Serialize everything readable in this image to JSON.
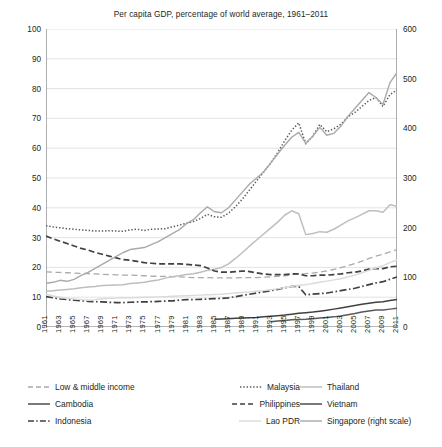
{
  "chart_data": {
    "type": "line",
    "title": "Per capita GDP, percentage of world average, 1961–2011",
    "xlabel": "",
    "ylabel": "",
    "ylabel_right": "",
    "xlim": [
      1961,
      2011
    ],
    "ylim": [
      0,
      100
    ],
    "ylim_right": [
      0,
      600
    ],
    "ytick_labels": [
      "100",
      "90",
      "80",
      "70",
      "60",
      "50",
      "40",
      "30",
      "20",
      "10",
      "0"
    ],
    "ytick_values": [
      100,
      90,
      80,
      70,
      60,
      50,
      40,
      30,
      20,
      10,
      0
    ],
    "ytick_right_labels": [
      "600",
      "500",
      "400",
      "300",
      "200",
      "100",
      "0"
    ],
    "ytick_right_values": [
      600,
      500,
      400,
      300,
      200,
      100,
      0
    ],
    "grid": "horizontal",
    "legend_position": "below",
    "xtick_labels": [
      "1961",
      "1963",
      "1965",
      "1967",
      "1969",
      "1971",
      "1973",
      "1975",
      "1977",
      "1979",
      "1981",
      "1983",
      "1985",
      "1987",
      "1989",
      "1991",
      "1993",
      "1995",
      "1997",
      "1999",
      "2001",
      "2003",
      "2005",
      "2007",
      "2009",
      "2011"
    ],
    "x": [
      1961,
      1962,
      1963,
      1964,
      1965,
      1966,
      1967,
      1968,
      1969,
      1970,
      1971,
      1972,
      1973,
      1974,
      1975,
      1976,
      1977,
      1978,
      1979,
      1980,
      1981,
      1982,
      1983,
      1984,
      1985,
      1986,
      1987,
      1988,
      1989,
      1990,
      1991,
      1992,
      1993,
      1994,
      1995,
      1996,
      1997,
      1998,
      1999,
      2000,
      2001,
      2002,
      2003,
      2004,
      2005,
      2006,
      2007,
      2008,
      2009,
      2010,
      2011
    ],
    "series": [
      {
        "name": "Low & middle income",
        "style": "dashed",
        "color": "#a7a9ac",
        "axis": "left",
        "values": [
          18.5,
          18.4,
          18.3,
          18.2,
          18.1,
          18.0,
          17.9,
          17.8,
          17.7,
          17.6,
          17.5,
          17.4,
          17.4,
          17.3,
          17.2,
          17.1,
          17.0,
          17.0,
          16.9,
          16.8,
          16.7,
          16.6,
          16.6,
          16.6,
          16.5,
          16.5,
          16.5,
          16.5,
          16.6,
          16.6,
          16.6,
          16.7,
          16.8,
          17.0,
          17.2,
          17.5,
          17.8,
          17.9,
          18.1,
          18.4,
          18.8,
          19.3,
          19.9,
          20.6,
          21.3,
          22.1,
          23.0,
          23.8,
          24.4,
          25.2,
          26.0
        ]
      },
      {
        "name": "Malaysia",
        "style": "dotted",
        "color": "#58595b",
        "axis": "left",
        "values": [
          34.0,
          33.6,
          33.3,
          33.0,
          32.8,
          32.6,
          32.4,
          32.2,
          32.2,
          32.3,
          32.2,
          32.1,
          32.6,
          32.8,
          32.4,
          32.8,
          32.9,
          33.0,
          33.6,
          34.2,
          34.8,
          35.4,
          36.4,
          37.8,
          37.0,
          36.8,
          38.2,
          40.4,
          43.0,
          46.0,
          49.0,
          52.0,
          55.0,
          58.5,
          62.5,
          66.0,
          68.5,
          61.5,
          64.0,
          68.0,
          65.5,
          66.5,
          68.0,
          70.5,
          72.0,
          74.0,
          76.0,
          77.0,
          74.0,
          78.0,
          79.5
        ]
      },
      {
        "name": "Thailand",
        "style": "solid",
        "color": "#bcbec0",
        "axis": "left",
        "values": [
          12.0,
          12.2,
          12.4,
          12.6,
          12.8,
          13.2,
          13.4,
          13.6,
          13.9,
          14.0,
          14.1,
          14.2,
          14.6,
          14.8,
          15.0,
          15.4,
          15.8,
          16.4,
          16.9,
          17.2,
          17.6,
          17.9,
          18.4,
          19.0,
          19.4,
          20.0,
          21.2,
          23.0,
          25.0,
          27.2,
          29.2,
          31.2,
          33.2,
          35.2,
          37.5,
          39.0,
          38.0,
          31.0,
          31.4,
          32.0,
          31.8,
          32.8,
          34.2,
          35.6,
          36.6,
          37.8,
          39.0,
          39.0,
          38.5,
          41.0,
          40.5
        ]
      },
      {
        "name": "Cambodia",
        "style": "solid",
        "color": "#58595b",
        "axis": "left",
        "values": [
          null,
          null,
          null,
          null,
          null,
          null,
          null,
          null,
          null,
          null,
          null,
          null,
          null,
          null,
          null,
          null,
          null,
          null,
          null,
          null,
          null,
          null,
          null,
          null,
          null,
          null,
          null,
          null,
          null,
          null,
          null,
          null,
          1.8,
          2.0,
          2.2,
          2.4,
          2.5,
          2.6,
          2.8,
          3.0,
          3.2,
          3.4,
          3.7,
          4.1,
          4.5,
          5.0,
          5.4,
          5.7,
          5.7,
          6.0,
          6.3
        ]
      },
      {
        "name": "Philippines",
        "style": "dashed-dark",
        "color": "#414042",
        "axis": "left",
        "values": [
          30.5,
          29.6,
          28.8,
          28.0,
          27.2,
          26.4,
          25.8,
          25.0,
          24.4,
          23.8,
          23.2,
          22.6,
          22.4,
          22.0,
          21.6,
          21.4,
          21.2,
          21.2,
          21.2,
          21.2,
          21.0,
          20.8,
          20.6,
          19.8,
          18.8,
          18.4,
          18.4,
          18.6,
          18.8,
          18.6,
          18.2,
          17.8,
          17.6,
          17.6,
          17.6,
          17.8,
          17.8,
          17.2,
          17.2,
          17.4,
          17.4,
          17.6,
          17.8,
          18.2,
          18.4,
          18.8,
          19.4,
          19.6,
          19.6,
          20.2,
          20.4
        ]
      },
      {
        "name": "Vietnam",
        "style": "solid",
        "color": "#414042",
        "axis": "left",
        "values": [
          null,
          null,
          null,
          null,
          null,
          null,
          null,
          null,
          null,
          null,
          null,
          null,
          null,
          null,
          null,
          null,
          null,
          null,
          null,
          null,
          null,
          null,
          null,
          null,
          2.6,
          2.7,
          2.8,
          2.9,
          3.0,
          3.1,
          3.2,
          3.4,
          3.6,
          3.8,
          4.0,
          4.3,
          4.6,
          4.8,
          5.0,
          5.3,
          5.6,
          6.0,
          6.4,
          6.8,
          7.2,
          7.6,
          8.0,
          8.3,
          8.5,
          8.9,
          9.2
        ]
      },
      {
        "name": "Indonesia",
        "style": "dash-dot",
        "color": "#414042",
        "axis": "left",
        "values": [
          10.2,
          9.8,
          9.4,
          9.2,
          9.0,
          8.8,
          8.6,
          8.5,
          8.4,
          8.3,
          8.2,
          8.2,
          8.3,
          8.4,
          8.4,
          8.5,
          8.6,
          8.7,
          8.8,
          9.0,
          9.2,
          9.2,
          9.3,
          9.4,
          9.5,
          9.6,
          9.8,
          10.2,
          10.6,
          11.0,
          11.4,
          11.8,
          12.2,
          12.6,
          13.2,
          13.6,
          13.6,
          10.8,
          11.0,
          11.2,
          11.4,
          11.8,
          12.2,
          12.6,
          13.0,
          13.6,
          14.2,
          14.8,
          15.2,
          16.0,
          16.8
        ]
      },
      {
        "name": "Lao PDR",
        "style": "solid-faint",
        "color": "#d9dadb",
        "axis": "left",
        "values": [
          11.0,
          10.4,
          10.0,
          9.6,
          9.4,
          9.2,
          9.0,
          9.2,
          9.5,
          9.6,
          9.7,
          9.8,
          9.8,
          9.9,
          10.0,
          10.0,
          10.1,
          10.2,
          10.3,
          10.4,
          10.5,
          10.6,
          10.7,
          10.8,
          10.9,
          11.0,
          11.2,
          11.4,
          11.6,
          11.8,
          12.0,
          12.2,
          12.5,
          12.8,
          13.2,
          13.6,
          14.0,
          14.2,
          14.6,
          15.0,
          15.4,
          15.8,
          16.2,
          16.8,
          17.4,
          18.2,
          19.0,
          19.8,
          20.6,
          21.6,
          22.5
        ]
      },
      {
        "name": "Singapore (right scale)",
        "style": "solid-light",
        "color": "#a7a9ac",
        "axis": "right",
        "values": [
          88,
          90,
          94,
          92,
          96,
          104,
          110,
          118,
          126,
          134,
          142,
          150,
          156,
          158,
          160,
          166,
          172,
          180,
          188,
          196,
          208,
          216,
          230,
          242,
          232,
          230,
          240,
          256,
          272,
          288,
          300,
          312,
          330,
          348,
          366,
          382,
          392,
          370,
          384,
          402,
          386,
          390,
          404,
          424,
          440,
          456,
          472,
          462,
          448,
          492,
          512
        ]
      }
    ]
  },
  "legend": {
    "rows": [
      [
        {
          "label": "Low & middle income",
          "swatch": "dashed-gray"
        },
        {
          "label": "Malaysia",
          "swatch": "dotted-gray"
        },
        {
          "label": "Thailand",
          "swatch": "solid-mid"
        }
      ],
      [
        {
          "label": "Cambodia",
          "swatch": "solid-dark"
        },
        {
          "label": "Philippines",
          "swatch": "dashed-dark"
        },
        {
          "label": "Vietnam",
          "swatch": "solid-dark"
        }
      ],
      [
        {
          "label": "Indonesia",
          "swatch": "dash-dot-dark"
        },
        {
          "label": "Lao PDR",
          "swatch": "solid-faint"
        },
        {
          "label": "Singapore (right scale)",
          "swatch": "solid-light"
        }
      ]
    ]
  },
  "colors": {
    "axis": "#6d6e71",
    "grid": "#d6d7d9",
    "text": "#231f20",
    "dark": "#414042",
    "mid": "#a7a9ac",
    "light": "#bcbec0",
    "faint": "#d9dadb"
  }
}
